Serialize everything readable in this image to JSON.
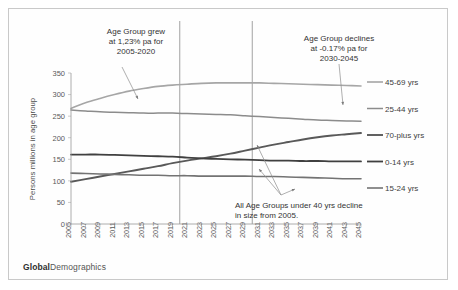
{
  "footer": {
    "brand_bold": "Global",
    "brand_rest": "Demographics"
  },
  "annotations": [
    {
      "id": "annot-growth",
      "lines": [
        "Age Group grew",
        "at 1,23% pa for",
        "2005-2020"
      ]
    },
    {
      "id": "annot-decline",
      "lines": [
        "Age Group declines",
        "at -0.17% pa for",
        "2030-2045"
      ]
    },
    {
      "id": "annot-under40",
      "lines": [
        "All Age Groups under 40 yrs decline",
        "in size from 2005."
      ]
    }
  ],
  "chart_data": {
    "type": "line",
    "title": "",
    "xlabel": "",
    "ylabel": "Persons millions in age group",
    "ylim": [
      0,
      350
    ],
    "yticks": [
      0,
      50,
      100,
      150,
      200,
      250,
      300,
      350
    ],
    "grid": false,
    "legend_position": "right",
    "x": [
      2005,
      2007,
      2009,
      2011,
      2013,
      2015,
      2017,
      2019,
      2021,
      2023,
      2025,
      2027,
      2029,
      2031,
      2033,
      2035,
      2037,
      2039,
      2041,
      2043,
      2045
    ],
    "categories": [
      "2005",
      "2007",
      "2009",
      "2011",
      "2013",
      "2015",
      "2017",
      "2019",
      "2021",
      "2023",
      "2025",
      "2027",
      "2029",
      "2031",
      "2033",
      "2035",
      "2037",
      "2039",
      "2041",
      "2043",
      "2045"
    ],
    "vertical_reference_lines": [
      2020,
      2030
    ],
    "series": [
      {
        "name": "45-69 yrs",
        "color": "#a6a6a6",
        "width": 1.6,
        "values": [
          268,
          281,
          291,
          300,
          308,
          314,
          319,
          322,
          324,
          326,
          327,
          327,
          327,
          327,
          326,
          325,
          324,
          323,
          322,
          321,
          320
        ]
      },
      {
        "name": "25-44 yrs",
        "color": "#8c8c8c",
        "width": 1.5,
        "values": [
          264,
          262,
          260,
          259,
          258,
          257,
          257,
          257,
          256,
          255,
          254,
          253,
          251,
          249,
          247,
          245,
          243,
          241,
          240,
          239,
          238
        ]
      },
      {
        "name": "70-plus yrs",
        "color": "#595959",
        "width": 1.9,
        "values": [
          98,
          104,
          110,
          116,
          122,
          128,
          134,
          141,
          147,
          152,
          157,
          163,
          170,
          177,
          184,
          190,
          196,
          201,
          205,
          208,
          211
        ]
      },
      {
        "name": "0-14 yrs",
        "color": "#404040",
        "width": 1.8,
        "values": [
          161,
          161,
          161,
          160,
          159,
          158,
          157,
          156,
          154,
          152,
          151,
          150,
          149,
          148,
          147,
          147,
          146,
          146,
          145,
          145,
          145
        ]
      },
      {
        "name": "15-24 yrs",
        "color": "#737373",
        "width": 1.6,
        "values": [
          118,
          117,
          116,
          115,
          114,
          113,
          113,
          112,
          112,
          111,
          111,
          111,
          111,
          110,
          110,
          109,
          108,
          107,
          106,
          105,
          105
        ]
      }
    ]
  }
}
